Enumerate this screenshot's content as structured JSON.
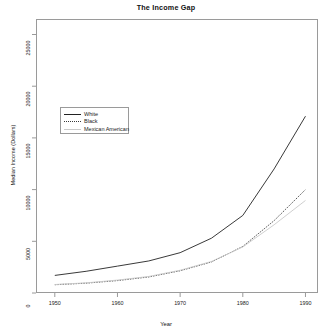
{
  "chart_data": {
    "type": "line",
    "title": "The Income Gap",
    "xlabel": "Year",
    "ylabel": "Median Income (Dollars)",
    "x": [
      1950,
      1955,
      1960,
      1965,
      1970,
      1975,
      1980,
      1985,
      1990
    ],
    "xlim": [
      1947,
      1992
    ],
    "ylim": [
      0,
      26500
    ],
    "xticks": [
      "1950",
      "1960",
      "1970",
      "1980",
      "1990"
    ],
    "xtick_values": [
      1950,
      1960,
      1970,
      1980,
      1990
    ],
    "yticks": [
      "0",
      "5000",
      "10000",
      "15000",
      "20000",
      "25000"
    ],
    "ytick_values": [
      0,
      5000,
      10000,
      15000,
      20000,
      25000
    ],
    "grid": false,
    "legend_position": "center-left",
    "series": [
      {
        "name": "White",
        "style": "solid",
        "color": "#222222",
        "values": [
          1700,
          2100,
          2600,
          3100,
          3900,
          5300,
          7500,
          12000,
          17100
        ]
      },
      {
        "name": "Black",
        "style": "dotted",
        "color": "#3a3a3a",
        "values": [
          800,
          950,
          1200,
          1550,
          2150,
          3000,
          4500,
          7000,
          10000
        ]
      },
      {
        "name": "Mexican American",
        "style": "light",
        "color": "#c9c9c9",
        "values": [
          820,
          980,
          1250,
          1600,
          2200,
          3050,
          4450,
          6600,
          8950
        ]
      }
    ]
  },
  "legend": {
    "items": [
      {
        "label": "White"
      },
      {
        "label": "Black"
      },
      {
        "label": "Mexican American"
      }
    ]
  }
}
